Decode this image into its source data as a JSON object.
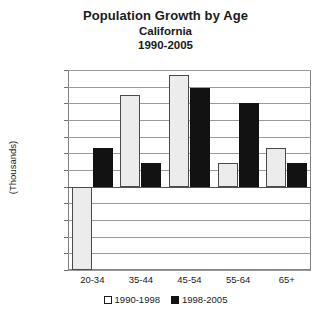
{
  "chart_data": {
    "type": "bar",
    "title": "Population Growth by Age",
    "subtitle": "California",
    "subtitle2": "1990-2005",
    "xlabel": "",
    "ylabel": "(Thousands)",
    "categories": [
      "20-34",
      "35-44",
      "45-54",
      "55-64",
      "65+"
    ],
    "series": [
      {
        "name": "1990-1998",
        "values": [
          -1000,
          1100,
          1340,
          290,
          470
        ]
      },
      {
        "name": "1998-2005",
        "values": [
          470,
          290,
          1190,
          1000,
          290
        ]
      }
    ],
    "ylim": [
      -1000,
      1400
    ],
    "ytick_step": 200,
    "ytick_labels": [
      "1,400",
      "1,200",
      "1,000",
      "800",
      "600",
      "400",
      "200",
      "0",
      "-200",
      "-400",
      "-600",
      "-800",
      "-1,000"
    ],
    "ytick_values": [
      1400,
      1200,
      1000,
      800,
      600,
      400,
      200,
      0,
      -200,
      -400,
      -600,
      -800,
      -1000
    ],
    "grid": true,
    "legend_position": "bottom",
    "colors": {
      "series_1_fill": "#ececec",
      "series_1_edge": "#4a4a4a",
      "series_2_fill": "#121212",
      "grid": "#9a9a9a",
      "frame": "#808080",
      "text": "#1a1a1a",
      "background": "#ffffff"
    }
  }
}
